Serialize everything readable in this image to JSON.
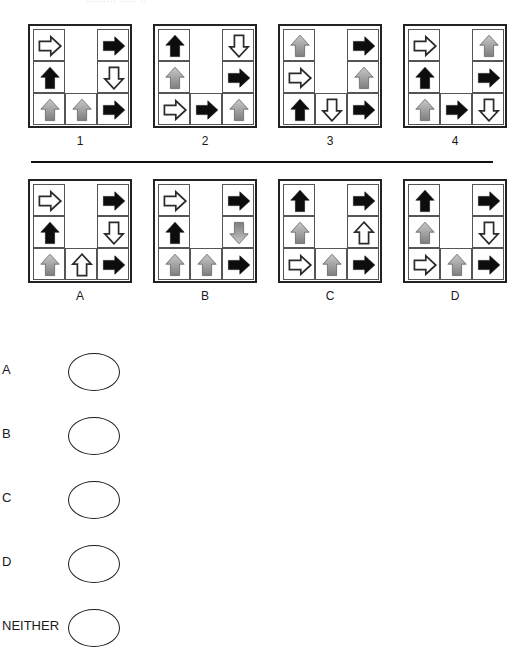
{
  "clipped_header_text": "......... ..... ..",
  "problem_row": {
    "panels": [
      {
        "label": "1",
        "cells": [
          {
            "pos": "top-left",
            "arrow": "right",
            "fill": "white"
          },
          {
            "pos": "top-center",
            "arrow": null,
            "fill": null
          },
          {
            "pos": "top-right",
            "arrow": "right",
            "fill": "black"
          },
          {
            "pos": "mid-left",
            "arrow": "up",
            "fill": "black"
          },
          {
            "pos": "mid-center",
            "arrow": null,
            "fill": null
          },
          {
            "pos": "mid-right",
            "arrow": "down",
            "fill": "white"
          },
          {
            "pos": "bot-left",
            "arrow": "up",
            "fill": "gray"
          },
          {
            "pos": "bot-center",
            "arrow": "up",
            "fill": "gray"
          },
          {
            "pos": "bot-right",
            "arrow": "right",
            "fill": "black"
          }
        ]
      },
      {
        "label": "2",
        "cells": [
          {
            "pos": "top-left",
            "arrow": "up",
            "fill": "black"
          },
          {
            "pos": "top-center",
            "arrow": null,
            "fill": null
          },
          {
            "pos": "top-right",
            "arrow": "down",
            "fill": "white"
          },
          {
            "pos": "mid-left",
            "arrow": "up",
            "fill": "gray"
          },
          {
            "pos": "mid-center",
            "arrow": null,
            "fill": null
          },
          {
            "pos": "mid-right",
            "arrow": "right",
            "fill": "black"
          },
          {
            "pos": "bot-left",
            "arrow": "right",
            "fill": "white"
          },
          {
            "pos": "bot-center",
            "arrow": "right",
            "fill": "black"
          },
          {
            "pos": "bot-right",
            "arrow": "up",
            "fill": "gray"
          }
        ]
      },
      {
        "label": "3",
        "cells": [
          {
            "pos": "top-left",
            "arrow": "up",
            "fill": "gray"
          },
          {
            "pos": "top-center",
            "arrow": null,
            "fill": null
          },
          {
            "pos": "top-right",
            "arrow": "right",
            "fill": "black"
          },
          {
            "pos": "mid-left",
            "arrow": "right",
            "fill": "white"
          },
          {
            "pos": "mid-center",
            "arrow": null,
            "fill": null
          },
          {
            "pos": "mid-right",
            "arrow": "up",
            "fill": "gray"
          },
          {
            "pos": "bot-left",
            "arrow": "up",
            "fill": "black"
          },
          {
            "pos": "bot-center",
            "arrow": "down",
            "fill": "white"
          },
          {
            "pos": "bot-right",
            "arrow": "right",
            "fill": "black"
          }
        ]
      },
      {
        "label": "4",
        "cells": [
          {
            "pos": "top-left",
            "arrow": "right",
            "fill": "white"
          },
          {
            "pos": "top-center",
            "arrow": null,
            "fill": null
          },
          {
            "pos": "top-right",
            "arrow": "up",
            "fill": "gray"
          },
          {
            "pos": "mid-left",
            "arrow": "up",
            "fill": "black"
          },
          {
            "pos": "mid-center",
            "arrow": null,
            "fill": null
          },
          {
            "pos": "mid-right",
            "arrow": "right",
            "fill": "black"
          },
          {
            "pos": "bot-left",
            "arrow": "up",
            "fill": "gray"
          },
          {
            "pos": "bot-center",
            "arrow": "right",
            "fill": "black"
          },
          {
            "pos": "bot-right",
            "arrow": "down",
            "fill": "white"
          }
        ]
      }
    ]
  },
  "option_row": {
    "panels": [
      {
        "label": "A",
        "cells": [
          {
            "pos": "top-left",
            "arrow": "right",
            "fill": "white"
          },
          {
            "pos": "top-center",
            "arrow": null,
            "fill": null
          },
          {
            "pos": "top-right",
            "arrow": "right",
            "fill": "black"
          },
          {
            "pos": "mid-left",
            "arrow": "up",
            "fill": "black"
          },
          {
            "pos": "mid-center",
            "arrow": null,
            "fill": null
          },
          {
            "pos": "mid-right",
            "arrow": "down",
            "fill": "white"
          },
          {
            "pos": "bot-left",
            "arrow": "up",
            "fill": "gray"
          },
          {
            "pos": "bot-center",
            "arrow": "up",
            "fill": "white"
          },
          {
            "pos": "bot-right",
            "arrow": "right",
            "fill": "black"
          }
        ]
      },
      {
        "label": "B",
        "cells": [
          {
            "pos": "top-left",
            "arrow": "right",
            "fill": "white"
          },
          {
            "pos": "top-center",
            "arrow": null,
            "fill": null
          },
          {
            "pos": "top-right",
            "arrow": "right",
            "fill": "black"
          },
          {
            "pos": "mid-left",
            "arrow": "up",
            "fill": "black"
          },
          {
            "pos": "mid-center",
            "arrow": null,
            "fill": null
          },
          {
            "pos": "mid-right",
            "arrow": "down",
            "fill": "gray"
          },
          {
            "pos": "bot-left",
            "arrow": "up",
            "fill": "gray"
          },
          {
            "pos": "bot-center",
            "arrow": "up",
            "fill": "gray"
          },
          {
            "pos": "bot-right",
            "arrow": "right",
            "fill": "black"
          }
        ]
      },
      {
        "label": "C",
        "cells": [
          {
            "pos": "top-left",
            "arrow": "up",
            "fill": "black"
          },
          {
            "pos": "top-center",
            "arrow": null,
            "fill": null
          },
          {
            "pos": "top-right",
            "arrow": "right",
            "fill": "black"
          },
          {
            "pos": "mid-left",
            "arrow": "up",
            "fill": "gray"
          },
          {
            "pos": "mid-center",
            "arrow": null,
            "fill": null
          },
          {
            "pos": "mid-right",
            "arrow": "up",
            "fill": "white"
          },
          {
            "pos": "bot-left",
            "arrow": "right",
            "fill": "white"
          },
          {
            "pos": "bot-center",
            "arrow": "up",
            "fill": "gray"
          },
          {
            "pos": "bot-right",
            "arrow": "right",
            "fill": "black"
          }
        ]
      },
      {
        "label": "D",
        "cells": [
          {
            "pos": "top-left",
            "arrow": "up",
            "fill": "black"
          },
          {
            "pos": "top-center",
            "arrow": null,
            "fill": null
          },
          {
            "pos": "top-right",
            "arrow": "right",
            "fill": "black"
          },
          {
            "pos": "mid-left",
            "arrow": "up",
            "fill": "gray"
          },
          {
            "pos": "mid-center",
            "arrow": null,
            "fill": null
          },
          {
            "pos": "mid-right",
            "arrow": "down",
            "fill": "white"
          },
          {
            "pos": "bot-left",
            "arrow": "right",
            "fill": "white"
          },
          {
            "pos": "bot-center",
            "arrow": "up",
            "fill": "gray"
          },
          {
            "pos": "bot-right",
            "arrow": "right",
            "fill": "black"
          }
        ]
      }
    ]
  },
  "answer_sheet": {
    "options": [
      {
        "label": "A",
        "selected": false
      },
      {
        "label": "B",
        "selected": false
      },
      {
        "label": "C",
        "selected": false
      },
      {
        "label": "D",
        "selected": false
      },
      {
        "label": "NEITHER",
        "selected": false
      }
    ]
  },
  "colors": {
    "black_arrow": "#0d0d0d",
    "white_arrow_stroke": "#2b2b2b",
    "white_arrow_fill": "#ffffff",
    "gray_arrow_light": "#c9c9c9",
    "gray_arrow_dark": "#7d7d7d",
    "panel_border": "#222222",
    "cell_border": "#555555",
    "divider": "#111111",
    "bubble_stroke": "#1d1d1d",
    "background": "#ffffff"
  }
}
